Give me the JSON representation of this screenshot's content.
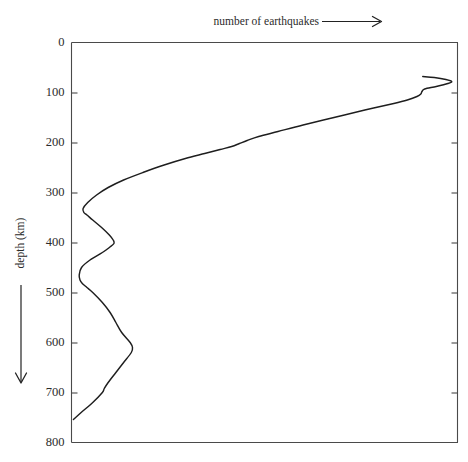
{
  "figure": {
    "background": "#ffffff",
    "line_color": "#1e1e1e",
    "axis_color": "#4a4a4a"
  },
  "chart_data": {
    "type": "line",
    "title": "",
    "xlabel": "number of earthquakes",
    "ylabel": "depth (km)",
    "xlabel_arrow": "right-arrow",
    "ylabel_arrow": "down-arrow",
    "grid": false,
    "legend": null,
    "x_axis": {
      "label": "number of earthquakes",
      "direction": "increasing to the right",
      "ticks_labeled": false,
      "tick_labels": []
    },
    "y_axis": {
      "label": "depth (km)",
      "direction": "increasing downward",
      "ylim": [
        0,
        800
      ],
      "tick_labels": [
        "0",
        "100",
        "200",
        "300",
        "400",
        "500",
        "600",
        "700",
        "800"
      ],
      "tick_values": [
        0,
        100,
        200,
        300,
        400,
        500,
        600,
        700,
        800
      ],
      "tick_side": "both"
    },
    "series": [
      {
        "name": "earthquake frequency vs depth",
        "comment": "relative number of earthquakes (x, arbitrary units 0-100) at each depth (y, km)",
        "depth_km": [
          754,
          740,
          720,
          700,
          692,
          680,
          660,
          640,
          620,
          610,
          600,
          580,
          560,
          540,
          520,
          500,
          490,
          482,
          475,
          465,
          450,
          435,
          420,
          410,
          402,
          395,
          385,
          370,
          355,
          345,
          340,
          332,
          320,
          305,
          290,
          275,
          260,
          245,
          232,
          222,
          214,
          208,
          202,
          196,
          188,
          178,
          165,
          150,
          135,
          122,
          115,
          108,
          103,
          98,
          93,
          88,
          82,
          78,
          74,
          70,
          68
        ],
        "relative_count": [
          0.5,
          2.5,
          5.5,
          8.0,
          8.5,
          9.5,
          11.5,
          13.5,
          15.5,
          15.8,
          15.2,
          13.0,
          11.5,
          10.0,
          8.0,
          5.5,
          4.0,
          2.8,
          2.2,
          2.0,
          2.6,
          4.8,
          8.0,
          9.8,
          11.0,
          10.8,
          9.8,
          7.8,
          5.5,
          4.0,
          3.2,
          3.0,
          4.2,
          6.5,
          9.5,
          13.5,
          18.5,
          24.0,
          29.5,
          34.5,
          38.5,
          41.5,
          43.5,
          45.5,
          48.5,
          53.5,
          60.0,
          68.0,
          76.0,
          83.5,
          87.0,
          89.5,
          90.5,
          90.8,
          91.5,
          94.5,
          97.5,
          98.5,
          97.0,
          94.0,
          91.0
        ]
      }
    ],
    "annotations": []
  }
}
